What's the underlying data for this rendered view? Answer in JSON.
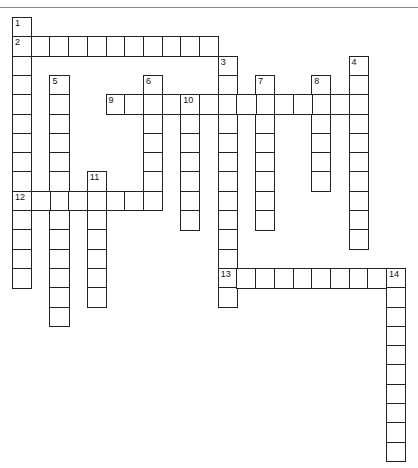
{
  "puzzle": {
    "grid": {
      "cols": 21,
      "rows": 23,
      "cell_width": 18.7,
      "cell_height": 19.3,
      "border_color": "#222222",
      "fill_color": "#ffffff"
    },
    "entries": [
      {
        "number": "1",
        "direction": "down",
        "row": 0,
        "col": 0,
        "length": 14
      },
      {
        "number": "2",
        "direction": "across",
        "row": 1,
        "col": 0,
        "length": 11
      },
      {
        "number": "3",
        "direction": "down",
        "row": 2,
        "col": 11,
        "length": 13
      },
      {
        "number": "4",
        "direction": "down",
        "row": 2,
        "col": 18,
        "length": 10
      },
      {
        "number": "5",
        "direction": "down",
        "row": 3,
        "col": 2,
        "length": 13
      },
      {
        "number": "6",
        "direction": "down",
        "row": 3,
        "col": 7,
        "length": 7
      },
      {
        "number": "7",
        "direction": "down",
        "row": 3,
        "col": 13,
        "length": 8
      },
      {
        "number": "8",
        "direction": "down",
        "row": 3,
        "col": 16,
        "length": 6
      },
      {
        "number": "9",
        "direction": "across",
        "row": 4,
        "col": 5,
        "length": 14
      },
      {
        "number": "10",
        "direction": "down",
        "row": 4,
        "col": 9,
        "length": 7
      },
      {
        "number": "11",
        "direction": "down",
        "row": 8,
        "col": 4,
        "length": 7
      },
      {
        "number": "12",
        "direction": "across",
        "row": 9,
        "col": 0,
        "length": 8
      },
      {
        "number": "13",
        "direction": "across",
        "row": 13,
        "col": 11,
        "length": 10
      },
      {
        "number": "14",
        "direction": "down",
        "row": 13,
        "col": 20,
        "length": 10
      }
    ]
  }
}
